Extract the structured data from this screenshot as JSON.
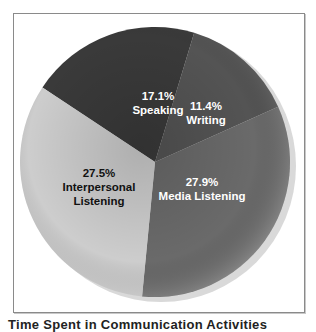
{
  "chart_data": {
    "type": "pie",
    "title": "",
    "caption": "Time Spent in Communication Activities",
    "categories": [
      "Speaking",
      "Writing",
      "Media Listening",
      "Interpersonal Listening"
    ],
    "values": [
      17.1,
      11.4,
      27.9,
      27.5
    ],
    "unit": "%",
    "labels": [
      "17.1%",
      "11.4%",
      "27.9%",
      "27.5%"
    ],
    "colors": [
      "#3a3a3a",
      "#545454",
      "#6a6a6a",
      "#cdcdcd"
    ],
    "label_colors": [
      "#ffffff",
      "#ffffff",
      "#ffffff",
      "#111111"
    ],
    "start_angle_deg": -56.5,
    "legend": "none (labels inside slices)",
    "grid": false
  },
  "slices": [
    {
      "percent": "17.1%",
      "name": "Speaking",
      "x": 158,
      "y": 103
    },
    {
      "percent": "11.4%",
      "name": "Writing",
      "x": 206,
      "y": 113
    },
    {
      "percent": "27.9%",
      "name": "Media Listening",
      "x": 202,
      "y": 189
    },
    {
      "percent": "27.5%",
      "name_line1": "Interpersonal",
      "name_line2": "Listening",
      "x": 99,
      "y": 187
    }
  ]
}
